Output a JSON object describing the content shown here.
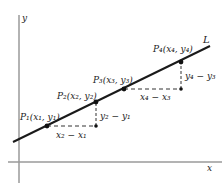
{
  "diagram": {
    "axes": {
      "x_label": "x",
      "y_label": "y"
    },
    "line": {
      "label": "L"
    },
    "points": [
      {
        "id": "P1",
        "label": "P₁(x₁, y₁)"
      },
      {
        "id": "P2",
        "label": "P₂(x₂, y₂)"
      },
      {
        "id": "P3",
        "label": "P₃(x₃, y₃)"
      },
      {
        "id": "P4",
        "label": "P₄(x₄, y₄)"
      }
    ],
    "differences": [
      {
        "id": "run12",
        "label": "x₂ − x₁"
      },
      {
        "id": "rise12",
        "label": "y₂ − y₁"
      },
      {
        "id": "run34",
        "label": "x₄ − x₃"
      },
      {
        "id": "rise34",
        "label": "y₄ − y₃"
      }
    ],
    "colors": {
      "axis": "#9a9a9a",
      "line": "#1a1a1a",
      "dashed": "#333333",
      "text": "#222222"
    }
  }
}
